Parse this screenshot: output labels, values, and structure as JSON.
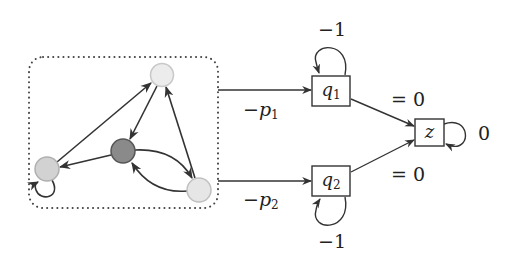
{
  "diagram": {
    "cluster": {
      "nodes": [
        {
          "id": "top",
          "fill": "#ececec",
          "stroke": "#c8c8c8"
        },
        {
          "id": "left",
          "fill": "#d2d2d2",
          "stroke": "#b0b0b0"
        },
        {
          "id": "middle",
          "fill": "#8a8a8a",
          "stroke": "#555555"
        },
        {
          "id": "bottom-right",
          "fill": "#e6e6e6",
          "stroke": "#c0c0c0"
        }
      ],
      "edges": [
        {
          "from": "left",
          "to": "top"
        },
        {
          "from": "top",
          "to": "middle"
        },
        {
          "from": "bottom-right",
          "to": "top"
        },
        {
          "from": "middle",
          "to": "left"
        },
        {
          "from": "middle",
          "to": "bottom-right"
        },
        {
          "from": "bottom-right",
          "to": "middle"
        },
        {
          "from": "left",
          "to": "left"
        }
      ]
    },
    "states": {
      "q1": {
        "var": "q",
        "sub": "1",
        "self_loop_label": "−1"
      },
      "q2": {
        "var": "q",
        "sub": "2",
        "self_loop_label": "−1"
      },
      "z": {
        "var": "z",
        "self_loop_label": "0"
      }
    },
    "edge_labels": {
      "to_q1_sign": "−",
      "to_q1_var": "p",
      "to_q1_sub": "1",
      "to_q2_sign": "−",
      "to_q2_var": "p",
      "to_q2_sub": "2",
      "q1_to_z": "= 0",
      "q2_to_z": "= 0"
    },
    "colors": {
      "line": "#333333",
      "dotted_border": "#444444"
    }
  }
}
